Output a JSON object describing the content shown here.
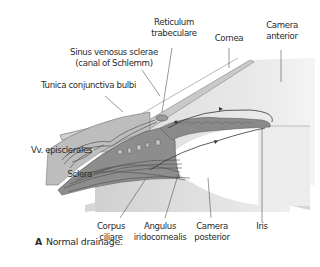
{
  "figure": {
    "caption_letter": "A",
    "caption_text": "Normal drainage.",
    "labels": {
      "reticulum_1": "Reticulum",
      "reticulum_2": "trabeculare",
      "cornea": "Cornea",
      "camera_anterior_1": "Camera",
      "camera_anterior_2": "anterior",
      "sinus_1": "Sinus venosus sclerae",
      "sinus_2": "(canal of Schlemm)",
      "tunica": "Tunica conjunctiva bulbi",
      "vv": "Vv. episclerales",
      "sclera": "Sclera",
      "corpus_1": "Corpus",
      "corpus_2": "ciliare",
      "angulus_1": "Angulus",
      "angulus_2": "iridocornealis",
      "camera_posterior_1": "Camera",
      "camera_posterior_2": "posterior",
      "iris": "Iris"
    },
    "colors": {
      "tissue_dark": "#8a8a8a",
      "tissue_mid": "#b3b3b3",
      "tissue_light": "#d4d4d4",
      "chamber": "#e6e6e6",
      "line": "#555555"
    }
  }
}
